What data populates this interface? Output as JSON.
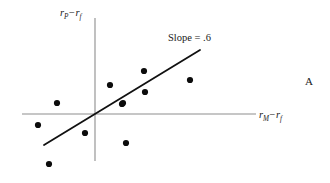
{
  "figure": {
    "panel_letter": "A",
    "background_color": "#ffffff",
    "axis_color": "#8d8d8d",
    "line_color": "#111111",
    "point_color": "#0c0c0c"
  },
  "labels": {
    "y_axis": {
      "var": "r",
      "sub": "P",
      "operator": "−",
      "var2": "r",
      "sub2": "f"
    },
    "x_axis": {
      "var": "r",
      "sub": "M",
      "operator": "−",
      "var2": "r",
      "sub2": "f"
    },
    "slope_annotation": "Slope = .6"
  },
  "chart_data": {
    "type": "scatter",
    "title": "",
    "subtitle": "",
    "xlabel": "rM - rf",
    "ylabel": "rP - rf",
    "annotations": [
      "Slope = .6",
      "A"
    ],
    "legend": [],
    "legend_position": "none",
    "grid": false,
    "xlim": [
      -1.0,
      1.0
    ],
    "ylim": [
      -1.0,
      1.0
    ],
    "origin_px": {
      "x": 95,
      "y": 114
    },
    "axes_px": {
      "x_axis": {
        "x1": 22,
        "y1": 114,
        "x2": 256,
        "y2": 114
      },
      "y_axis": {
        "x1": 95,
        "y1": 18,
        "x2": 95,
        "y2": 161
      }
    },
    "regression_line": {
      "slope": 0.6,
      "label": "Slope = .6",
      "px": {
        "x1": 44,
        "y1": 145,
        "x2": 200,
        "y2": 50
      }
    },
    "points_px": [
      {
        "x": 38,
        "y": 125
      },
      {
        "x": 57,
        "y": 103
      },
      {
        "x": 49,
        "y": 164
      },
      {
        "x": 85,
        "y": 133
      },
      {
        "x": 110,
        "y": 85
      },
      {
        "x": 123,
        "y": 103
      },
      {
        "x": 126,
        "y": 143
      },
      {
        "x": 144,
        "y": 71
      },
      {
        "x": 145,
        "y": 92
      },
      {
        "x": 122,
        "y": 104
      },
      {
        "x": 190,
        "y": 80
      }
    ],
    "points": [
      {
        "x": -0.78,
        "y": -0.15
      },
      {
        "x": -0.52,
        "y": 0.15
      },
      {
        "x": -0.63,
        "y": -0.69
      },
      {
        "x": -0.14,
        "y": -0.26
      },
      {
        "x": 0.21,
        "y": 0.4
      },
      {
        "x": 0.38,
        "y": 0.15
      },
      {
        "x": 0.42,
        "y": -0.4
      },
      {
        "x": 0.67,
        "y": 0.59
      },
      {
        "x": 0.68,
        "y": 0.3
      },
      {
        "x": 0.37,
        "y": 0.14
      },
      {
        "x": 1.3,
        "y": 0.47
      }
    ],
    "point_radius_px": 3.1,
    "n_points": 11
  }
}
